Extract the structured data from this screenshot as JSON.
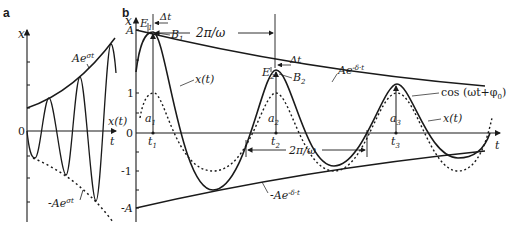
{
  "figure": {
    "panel_a": {
      "label": "a",
      "y_axis": "x",
      "x_axis": "t",
      "origin": "0",
      "curve": "x(t)",
      "envelope_upper": "Ae",
      "envelope_upper_exp": "σt",
      "envelope_lower": "-Ae",
      "envelope_lower_exp": "σt"
    },
    "panel_b": {
      "label": "b",
      "y_axis": "x",
      "x_axis": "t",
      "ticks": {
        "A": "A",
        "one": "1",
        "zero": "0",
        "minus_one": "-1",
        "minus_A": "-A"
      },
      "period_top": "2π/ω",
      "period_bottom": "2π/ω",
      "delta_t_1": "Δt",
      "delta_t_2": "Δt",
      "E1": "E",
      "E1_sub": "1",
      "B1": "B",
      "B1_sub": "1",
      "E2": "E",
      "E2_sub": "2",
      "B2": "B",
      "B2_sub": "2",
      "a1": "a",
      "a1_sub": "1",
      "a2": "a",
      "a2_sub": "2",
      "a3": "a",
      "a3_sub": "3",
      "t1": "t",
      "t1_sub": "1",
      "t2": "t",
      "t2_sub": "2",
      "t3": "t",
      "t3_sub": "3",
      "curve_1": "x(t)",
      "curve_2": "x(t)",
      "env_upper": "Ae",
      "env_upper_exp": "-δ·t",
      "env_lower": "-Ae",
      "env_lower_exp": "-δ·t",
      "cos_label": "cos (ωt+φ",
      "cos_sub": "0",
      "cos_close": ")"
    }
  }
}
